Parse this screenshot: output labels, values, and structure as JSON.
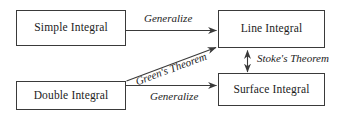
{
  "diagram": {
    "background_color": "#ffffff",
    "stroke_color": "#3a3a3a",
    "text_color": "#1c1c1c",
    "nodes": [
      {
        "id": "simple-integral",
        "label": "Simple Integral"
      },
      {
        "id": "line-integral",
        "label": "Line Integral"
      },
      {
        "id": "double-integral",
        "label": "Double Integral"
      },
      {
        "id": "surface-integral",
        "label": "Surface Integral"
      }
    ],
    "edges": [
      {
        "id": "generalize-top",
        "label": "Generalize",
        "from": "simple-integral",
        "to": "line-integral",
        "style": "single-arrow",
        "direction": "horizontal"
      },
      {
        "id": "generalize-bottom",
        "label": "Generalize",
        "from": "double-integral",
        "to": "surface-integral",
        "style": "single-arrow",
        "direction": "horizontal"
      },
      {
        "id": "greens-theorem",
        "label": "Green's Theorem",
        "from": "double-integral",
        "to": "line-integral",
        "style": "single-arrow",
        "direction": "diagonal-up-right"
      },
      {
        "id": "stokes-theorem",
        "label": "Stoke's Theorem",
        "from": "line-integral",
        "to": "surface-integral",
        "style": "double-arrow",
        "direction": "vertical"
      }
    ]
  }
}
